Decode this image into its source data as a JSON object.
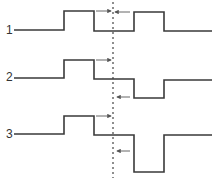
{
  "diagram": {
    "type": "timing-waveforms",
    "colors": {
      "line": "#3a3a3a",
      "arrow": "#555555",
      "background": "#ffffff"
    },
    "reference_line": {
      "x": 113,
      "style": "dotted"
    },
    "traces": [
      {
        "label": "1",
        "label_pos": [
          6,
          34
        ],
        "points": "14,30 64,30 64,11 94,11 94,31 134,31 134,12 164,12 164,31 212,31",
        "arrows": [
          {
            "direction": "right",
            "x1": 96,
            "x2": 111,
            "y": 11
          },
          {
            "direction": "left",
            "x1": 130,
            "x2": 115,
            "y": 12
          }
        ]
      },
      {
        "label": "2",
        "label_pos": [
          6,
          81
        ],
        "points": "14,78 64,78 64,60 94,60 94,79 134,79 134,98 164,98 164,80 212,80",
        "arrows": [
          {
            "direction": "right",
            "x1": 96,
            "x2": 111,
            "y": 60
          },
          {
            "direction": "left",
            "x1": 130,
            "x2": 117,
            "y": 97
          }
        ]
      },
      {
        "label": "3",
        "label_pos": [
          6,
          138
        ],
        "points": "14,134 64,134 64,116 94,116 94,135 134,135 134,172 164,172 164,135 212,135",
        "arrows": [
          {
            "direction": "right",
            "x1": 96,
            "x2": 111,
            "y": 116
          },
          {
            "direction": "left",
            "x1": 130,
            "x2": 117,
            "y": 151
          }
        ]
      }
    ]
  }
}
